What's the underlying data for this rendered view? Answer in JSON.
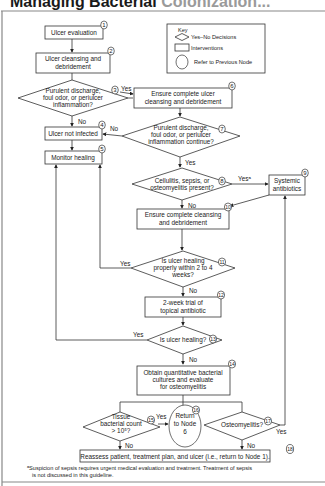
{
  "title": {
    "main": "Managing Bacterial",
    "sub": "Colonization..."
  },
  "key": {
    "heading": "Key",
    "items": [
      {
        "shape": "diamond",
        "label": "Yes–No Decisions"
      },
      {
        "shape": "rectangle",
        "label": "Interventions"
      },
      {
        "shape": "oval",
        "label": "Refer to Previous Node"
      }
    ]
  },
  "nodes": {
    "n1": {
      "num": "1",
      "lines": [
        "Ulcer evaluation"
      ]
    },
    "n2": {
      "num": "2",
      "lines": [
        "Ulcer cleansing and",
        "debridement"
      ]
    },
    "n3": {
      "num": "3",
      "lines": [
        "Purulent discharge,",
        "foul odor, or periulcer",
        "inflammation?"
      ]
    },
    "n4": {
      "num": "4",
      "lines": [
        "Ulcer not infected"
      ]
    },
    "n5": {
      "num": "5",
      "lines": [
        "Monitor healing"
      ]
    },
    "n6": {
      "num": "6",
      "lines": [
        "Ensure complete ulcer",
        "cleansing and debridement"
      ]
    },
    "n7": {
      "num": "7",
      "lines": [
        "Purulent discharge,",
        "foul odor, or periulcer",
        "inflammation continue?"
      ]
    },
    "n8": {
      "num": "8",
      "lines": [
        "Cellulitis, sepsis, or",
        "osteomyelitis present?"
      ]
    },
    "n9": {
      "num": "9",
      "lines": [
        "Systemic",
        "antibiotics"
      ]
    },
    "n10": {
      "num": "10",
      "lines": [
        "Ensure complete cleansing",
        "and debridement"
      ]
    },
    "n11": {
      "num": "11",
      "lines": [
        "Is ulcer healing",
        "properly within 2 to 4",
        "weeks?"
      ]
    },
    "n12": {
      "num": "12",
      "lines": [
        "2-week trial of",
        "topical antibiotic"
      ]
    },
    "n13": {
      "num": "13",
      "lines": [
        "Is ulcer healing?"
      ]
    },
    "n14": {
      "num": "14",
      "lines": [
        "Obtain quantitative bacterial",
        "cultures and evaluate",
        "for osteomyelitis"
      ]
    },
    "n15": {
      "num": "15",
      "lines": [
        "Tissue",
        "bacterial count",
        "> 10⁵?"
      ]
    },
    "n16": {
      "num": "16",
      "lines": [
        "Return",
        "to Node",
        "6"
      ]
    },
    "n17": {
      "num": "17",
      "lines": [
        "Osteomyelitis?"
      ]
    },
    "n18": {
      "num": "18",
      "lines": [
        "Reassess patient, treatment plan, and ulcer (i.e., return to Node 1)."
      ]
    }
  },
  "edge_labels": {
    "n3_yes": "Yes",
    "n3_no": "No",
    "n7_no": "No",
    "n7_yes": "Yes",
    "n8_yes": "Yesᵃ",
    "n8_no": "No",
    "n11_yes": "Yes",
    "n11_no": "No",
    "n13_yes": "Yes",
    "n13_no": "No",
    "n15_yes": "Yes",
    "n15_no": "No",
    "n17_yes": "Yes",
    "n17_no": "No"
  },
  "footnote": {
    "line1": "ᵃSuspicion of sepsis requires urgent medical evaluation and treatment. Treatment of sepsis",
    "line2": "is not discussed in this guideline."
  }
}
